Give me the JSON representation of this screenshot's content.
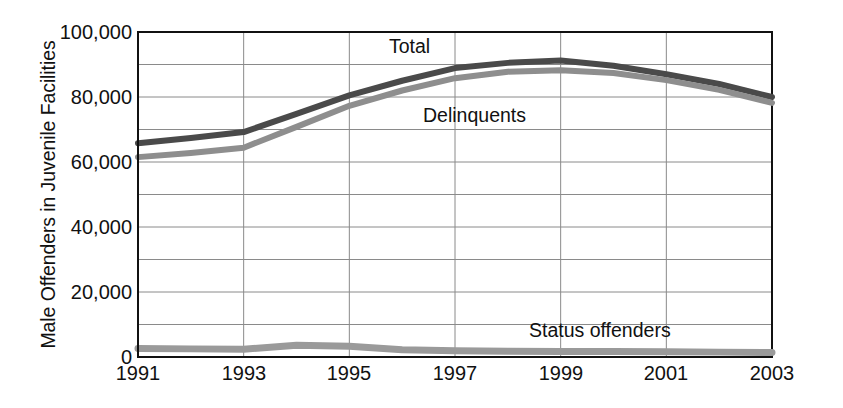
{
  "chart_data": {
    "type": "line",
    "title": "",
    "xlabel": "",
    "ylabel": "Male Offenders in Juvenile Facilities",
    "xlim": [
      1991,
      2003
    ],
    "ylim": [
      0,
      100000
    ],
    "grid": true,
    "legend_position": "inline-annotations",
    "x": [
      1991,
      1992,
      1993,
      1994,
      1995,
      1996,
      1997,
      1998,
      1999,
      2000,
      2001,
      2002,
      2003
    ],
    "xtick_labels": [
      "1991",
      "1993",
      "1995",
      "1997",
      "1999",
      "2001",
      "2003"
    ],
    "xtick_values": [
      1991,
      1993,
      1995,
      1997,
      1999,
      2001,
      2003
    ],
    "ytick_labels": [
      "0",
      "20,000",
      "40,000",
      "60,000",
      "80,000",
      "100,000"
    ],
    "ytick_values": [
      0,
      20000,
      40000,
      60000,
      80000,
      100000
    ],
    "minor_ytick_values": [
      10000,
      30000,
      50000,
      70000,
      90000
    ],
    "series": [
      {
        "name": "Total",
        "color": "#4a4a4a",
        "values": [
          65800,
          67400,
          69200,
          74800,
          80500,
          85000,
          88900,
          90500,
          91200,
          89600,
          87000,
          84000,
          80000
        ]
      },
      {
        "name": "Delinquents",
        "color": "#8e8e8e",
        "values": [
          61500,
          62800,
          64400,
          70800,
          77300,
          82000,
          85800,
          87800,
          88200,
          87400,
          85200,
          82200,
          78200
        ]
      },
      {
        "name": "Status offenders",
        "color": "#9a9a9a",
        "values": [
          2600,
          2500,
          2400,
          3600,
          3300,
          2200,
          1900,
          1800,
          1700,
          1700,
          1600,
          1500,
          1400
        ]
      }
    ],
    "annotations": [
      {
        "text": "Total",
        "x": 1996.4,
        "y": 97000
      },
      {
        "text": "Delinquents",
        "x": 1997.0,
        "y": 78000
      },
      {
        "text": "Status offenders",
        "x": 1999.6,
        "y": 11500
      }
    ]
  },
  "axis": {
    "y_title": "Male Offenders in Juvenile Facilities"
  }
}
